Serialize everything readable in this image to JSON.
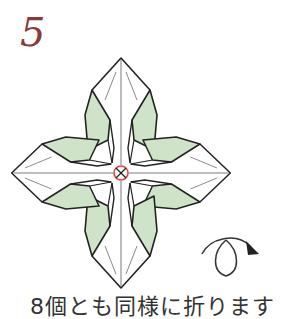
{
  "step": {
    "number": "5"
  },
  "caption": "8個とも同様に折ります",
  "icons": {
    "center_mark": "circle-x-center-icon",
    "turn_over": "turn-over-arrow-icon"
  },
  "colors": {
    "step_number": "#8a3a36",
    "fill_green": "#cfe3c8",
    "outline": "#222222",
    "center_circle": "#e0473a"
  }
}
